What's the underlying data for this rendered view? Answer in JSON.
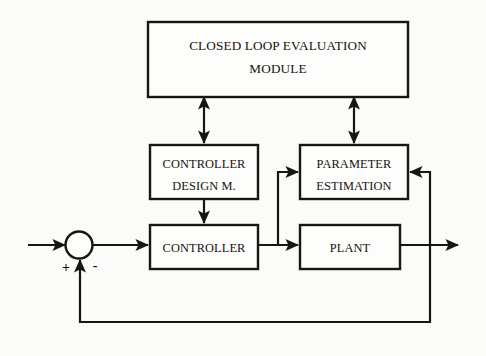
{
  "diagram": {
    "background_color": "#fbfbf9",
    "line_color": "#181612",
    "blocks": [
      {
        "id": "closed-loop-evaluation-module",
        "line1": "CLOSED LOOP EVALUATION",
        "line2": "MODULE"
      },
      {
        "id": "controller-design-m",
        "line1": "CONTROLLER",
        "line2": "DESIGN M."
      },
      {
        "id": "parameter-estimation",
        "line1": "PARAMETER",
        "line2": "ESTIMATION"
      },
      {
        "id": "controller",
        "line1": "CONTROLLER",
        "line2": ""
      },
      {
        "id": "plant",
        "line1": "PLANT",
        "line2": ""
      }
    ],
    "summing_junction": {
      "plus_sign": "+",
      "minus_sign": "-"
    }
  }
}
